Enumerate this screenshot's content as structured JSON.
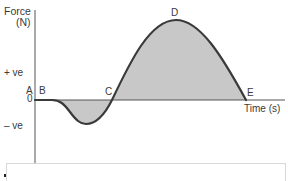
{
  "diagram": {
    "y_axis_label": "Force",
    "y_axis_unit": "(N)",
    "x_axis_label": "Time (s)",
    "positive_label": "+ ve",
    "negative_label": "– ve",
    "origin_label": "0",
    "points": {
      "A": "A",
      "B": "B",
      "C": "C",
      "D": "D",
      "E": "E"
    },
    "colors": {
      "curve": "#3a3a3a",
      "fill": "#c8c8c8",
      "axis": "#555555"
    }
  }
}
